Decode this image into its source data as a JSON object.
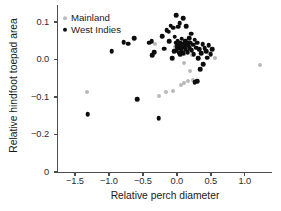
{
  "chart_data": {
    "type": "scatter",
    "title": "",
    "xlabel": "Relative perch diameter",
    "ylabel": "Relative hindfoot toepad area",
    "xlim": [
      -1.75,
      1.4
    ],
    "ylim": [
      -0.3,
      0.145
    ],
    "xticks": [
      -1.5,
      -1.0,
      -0.5,
      0.0,
      0.5,
      1.0
    ],
    "xticklabels": [
      "−1.5",
      "−1.0",
      "−0.5",
      "0.0",
      "0.5",
      "1.0"
    ],
    "yticks": [
      0.1,
      0.0,
      -0.1,
      -0.2,
      -0.3
    ],
    "yticklabels": [
      "0.1",
      "0.0",
      "−0.1",
      "−0.2",
      "0"
    ],
    "grid": false,
    "legend_position": "top-left",
    "colors": {
      "mainland": "#b9b9b9",
      "west_indies": "#0d0d0d",
      "axis": "#4d4d4d",
      "text": "#1a1a1a",
      "background": "#ffffff"
    },
    "series": [
      {
        "name": "Mainland",
        "marker": "circle",
        "color": "#b9b9b9",
        "marker_size": 4.0,
        "points": [
          [
            -1.33,
            -0.088
          ],
          [
            -0.32,
            0.04
          ],
          [
            -0.03,
            0.034
          ],
          [
            0.09,
            0.03
          ],
          [
            0.06,
            0.028
          ],
          [
            0.14,
            0.031
          ],
          [
            0.11,
            -0.01
          ],
          [
            0.22,
            0.012
          ],
          [
            0.2,
            -0.032
          ],
          [
            0.23,
            -0.054
          ],
          [
            0.16,
            -0.057
          ],
          [
            0.06,
            -0.067
          ],
          [
            0.11,
            -0.063
          ],
          [
            -0.05,
            -0.083
          ],
          [
            -0.16,
            -0.086
          ],
          [
            -0.27,
            -0.098
          ],
          [
            0.48,
            0.018
          ],
          [
            0.56,
            0.005
          ],
          [
            1.22,
            -0.015
          ]
        ]
      },
      {
        "name": "West Indies",
        "marker": "circle",
        "color": "#0d0d0d",
        "marker_size": 4.6,
        "points": [
          [
            -1.31,
            -0.146
          ],
          [
            -0.96,
            0.022
          ],
          [
            -0.78,
            0.046
          ],
          [
            -0.72,
            0.042
          ],
          [
            -0.63,
            0.057
          ],
          [
            -0.58,
            -0.106
          ],
          [
            -0.41,
            0.044
          ],
          [
            -0.37,
            0.049
          ],
          [
            -0.36,
            0.012
          ],
          [
            -0.33,
            0.019
          ],
          [
            -0.27,
            -0.156
          ],
          [
            -0.22,
            0.062
          ],
          [
            -0.19,
            0.029
          ],
          [
            -0.15,
            0.078
          ],
          [
            -0.12,
            0.074
          ],
          [
            -0.11,
            0.048
          ],
          [
            -0.09,
            0.09
          ],
          [
            -0.07,
            0.004
          ],
          [
            -0.05,
            0.084
          ],
          [
            -0.04,
            0.022
          ],
          [
            -0.03,
            0.06
          ],
          [
            -0.02,
            0.044
          ],
          [
            -0.01,
            0.118
          ],
          [
            0.0,
            0.035
          ],
          [
            0.0,
            0.024
          ],
          [
            0.01,
            0.049
          ],
          [
            0.02,
            0.031
          ],
          [
            0.02,
            0.087
          ],
          [
            0.03,
            0.04
          ],
          [
            0.03,
            0.018
          ],
          [
            0.04,
            0.096
          ],
          [
            0.04,
            0.029
          ],
          [
            0.05,
            0.045
          ],
          [
            0.05,
            0.013
          ],
          [
            0.06,
            0.038
          ],
          [
            0.07,
            0.055
          ],
          [
            0.07,
            0.022
          ],
          [
            0.08,
            0.033
          ],
          [
            0.09,
            0.11
          ],
          [
            0.09,
            0.042
          ],
          [
            0.1,
            0.016
          ],
          [
            0.11,
            0.038
          ],
          [
            0.12,
            0.05
          ],
          [
            0.13,
            0.028
          ],
          [
            0.14,
            0.088
          ],
          [
            0.15,
            0.043
          ],
          [
            0.16,
            0.02
          ],
          [
            0.17,
            0.036
          ],
          [
            0.18,
            0.056
          ],
          [
            0.19,
            0.03
          ],
          [
            0.2,
            0.045
          ],
          [
            0.21,
            0.068
          ],
          [
            0.22,
            0.025
          ],
          [
            0.24,
            0.039
          ],
          [
            0.25,
            0.014
          ],
          [
            0.26,
            0.052
          ],
          [
            0.28,
            0.031
          ],
          [
            0.3,
            0.044
          ],
          [
            0.31,
            0.003
          ],
          [
            0.33,
            0.027
          ],
          [
            0.34,
            -0.026
          ],
          [
            0.36,
            0.016
          ],
          [
            0.38,
            0.04
          ],
          [
            0.39,
            -0.012
          ],
          [
            0.41,
            0.03
          ],
          [
            0.43,
            0.022
          ],
          [
            0.45,
            0.005
          ],
          [
            0.47,
            0.038
          ],
          [
            0.5,
            0.014
          ],
          [
            0.52,
            0.028
          ],
          [
            0.3,
            -0.058
          ],
          [
            0.26,
            -0.06
          ]
        ]
      }
    ]
  },
  "legend": {
    "items": [
      {
        "label": "Mainland"
      },
      {
        "label": "West Indies"
      }
    ]
  }
}
